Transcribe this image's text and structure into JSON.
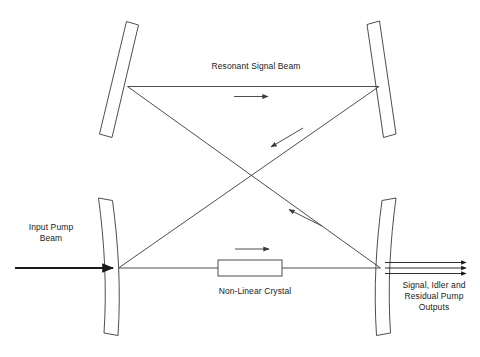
{
  "diagram": {
    "stroke_color": "#3a3a3a",
    "thick_stroke_color": "#1a1a1a",
    "text_color": "#1a1a1a",
    "background": "#ffffff"
  },
  "labels": {
    "resonant_signal_beam": "Resonant Signal Beam",
    "input_pump_beam": "Input Pump\nBeam",
    "non_linear_crystal": "Non-Linear Crystal",
    "outputs": "Signal, Idler and\nResidual Pump\nOutputs"
  },
  "components": {
    "mirror_top_left": "mirror-top-left",
    "mirror_top_right": "mirror-top-right",
    "mirror_bottom_left": "mirror-bottom-left-concave",
    "mirror_bottom_right": "mirror-bottom-right-concave",
    "crystal": "non-linear-crystal-block"
  },
  "beams": [
    {
      "name": "top-horizontal-beam",
      "direction": "right"
    },
    {
      "name": "diagonal-beam-upper-right-to-lower-left",
      "direction": "down-left"
    },
    {
      "name": "diagonal-beam-lower-left-to-upper-right",
      "direction": "up-right"
    },
    {
      "name": "bottom-horizontal-beam",
      "direction": "right"
    },
    {
      "name": "input-pump-beam",
      "direction": "right"
    },
    {
      "name": "output-beam-1",
      "direction": "right"
    },
    {
      "name": "output-beam-2",
      "direction": "right"
    },
    {
      "name": "output-beam-3",
      "direction": "right"
    }
  ]
}
